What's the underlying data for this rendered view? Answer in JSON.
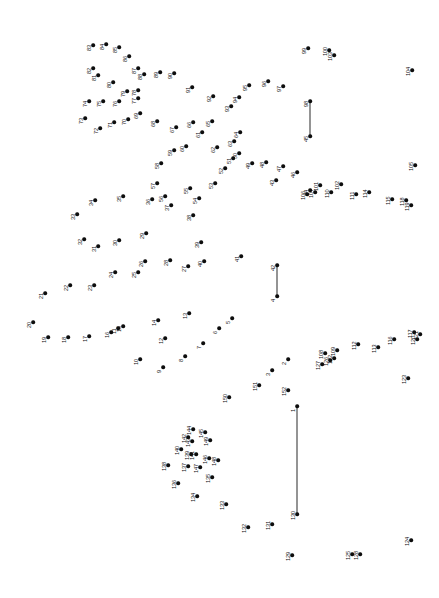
{
  "page": {
    "width": 439,
    "height": 598,
    "background_color": "#ffffff",
    "dot_color": "#0d0d0d",
    "label_color": "#111111",
    "line_color": "#2b2b2b",
    "label_rotation_degrees": -90,
    "total_dots": 152
  },
  "chart_data": {
    "type": "scatter",
    "xlabel": "",
    "ylabel": "",
    "xlim": [
      0,
      439
    ],
    "ylim": [
      0,
      598
    ],
    "grid": false,
    "legend": "none",
    "dots": [
      {
        "n": "1",
        "x": 297,
        "y": 406
      },
      {
        "n": "2",
        "x": 288,
        "y": 359
      },
      {
        "n": "3",
        "x": 272,
        "y": 370
      },
      {
        "n": "4",
        "x": 277,
        "y": 296
      },
      {
        "n": "5",
        "x": 232,
        "y": 318
      },
      {
        "n": "6",
        "x": 219,
        "y": 328
      },
      {
        "n": "7",
        "x": 203,
        "y": 343
      },
      {
        "n": "8",
        "x": 185,
        "y": 356
      },
      {
        "n": "9",
        "x": 163,
        "y": 367
      },
      {
        "n": "10",
        "x": 140,
        "y": 359
      },
      {
        "n": "11",
        "x": 118,
        "y": 328
      },
      {
        "n": "12",
        "x": 165,
        "y": 338
      },
      {
        "n": "13",
        "x": 189,
        "y": 313
      },
      {
        "n": "14",
        "x": 158,
        "y": 320
      },
      {
        "n": "15",
        "x": 123,
        "y": 326
      },
      {
        "n": "16",
        "x": 111,
        "y": 332
      },
      {
        "n": "17",
        "x": 89,
        "y": 336
      },
      {
        "n": "18",
        "x": 68,
        "y": 337
      },
      {
        "n": "19",
        "x": 48,
        "y": 337
      },
      {
        "n": "20",
        "x": 33,
        "y": 322
      },
      {
        "n": "21",
        "x": 45,
        "y": 293
      },
      {
        "n": "22",
        "x": 70,
        "y": 285
      },
      {
        "n": "23",
        "x": 94,
        "y": 285
      },
      {
        "n": "24",
        "x": 115,
        "y": 272
      },
      {
        "n": "25",
        "x": 138,
        "y": 272
      },
      {
        "n": "26",
        "x": 145,
        "y": 261
      },
      {
        "n": "27",
        "x": 188,
        "y": 266
      },
      {
        "n": "28",
        "x": 170,
        "y": 260
      },
      {
        "n": "29",
        "x": 146,
        "y": 233
      },
      {
        "n": "30",
        "x": 119,
        "y": 240
      },
      {
        "n": "31",
        "x": 98,
        "y": 246
      },
      {
        "n": "32",
        "x": 84,
        "y": 239
      },
      {
        "n": "33",
        "x": 77,
        "y": 214
      },
      {
        "n": "34",
        "x": 95,
        "y": 200
      },
      {
        "n": "35",
        "x": 123,
        "y": 196
      },
      {
        "n": "36",
        "x": 152,
        "y": 199
      },
      {
        "n": "37",
        "x": 171,
        "y": 205
      },
      {
        "n": "38",
        "x": 193,
        "y": 215
      },
      {
        "n": "39",
        "x": 201,
        "y": 242
      },
      {
        "n": "40",
        "x": 204,
        "y": 261
      },
      {
        "n": "41",
        "x": 241,
        "y": 256
      },
      {
        "n": "42",
        "x": 277,
        "y": 265
      },
      {
        "n": "43",
        "x": 276,
        "y": 180
      },
      {
        "n": "44",
        "x": 310,
        "y": 190
      },
      {
        "n": "45",
        "x": 310,
        "y": 136
      },
      {
        "n": "46",
        "x": 297,
        "y": 172
      },
      {
        "n": "47",
        "x": 283,
        "y": 166
      },
      {
        "n": "48",
        "x": 266,
        "y": 162
      },
      {
        "n": "49",
        "x": 252,
        "y": 163
      },
      {
        "n": "50",
        "x": 239,
        "y": 153
      },
      {
        "n": "51",
        "x": 233,
        "y": 158
      },
      {
        "n": "52",
        "x": 225,
        "y": 168
      },
      {
        "n": "53",
        "x": 215,
        "y": 183
      },
      {
        "n": "54",
        "x": 199,
        "y": 198
      },
      {
        "n": "55",
        "x": 190,
        "y": 188
      },
      {
        "n": "56",
        "x": 165,
        "y": 196
      },
      {
        "n": "57",
        "x": 157,
        "y": 183
      },
      {
        "n": "58",
        "x": 161,
        "y": 163
      },
      {
        "n": "59",
        "x": 174,
        "y": 150
      },
      {
        "n": "60",
        "x": 186,
        "y": 146
      },
      {
        "n": "61",
        "x": 202,
        "y": 132
      },
      {
        "n": "62",
        "x": 217,
        "y": 147
      },
      {
        "n": "63",
        "x": 234,
        "y": 141
      },
      {
        "n": "64",
        "x": 240,
        "y": 132
      },
      {
        "n": "65",
        "x": 212,
        "y": 121
      },
      {
        "n": "66",
        "x": 193,
        "y": 122
      },
      {
        "n": "67",
        "x": 176,
        "y": 127
      },
      {
        "n": "68",
        "x": 157,
        "y": 121
      },
      {
        "n": "69",
        "x": 140,
        "y": 113
      },
      {
        "n": "70",
        "x": 128,
        "y": 119
      },
      {
        "n": "71",
        "x": 114,
        "y": 122
      },
      {
        "n": "72",
        "x": 100,
        "y": 128
      },
      {
        "n": "73",
        "x": 85,
        "y": 118
      },
      {
        "n": "74",
        "x": 89,
        "y": 101
      },
      {
        "n": "75",
        "x": 103,
        "y": 101
      },
      {
        "n": "76",
        "x": 119,
        "y": 101
      },
      {
        "n": "77",
        "x": 138,
        "y": 98
      },
      {
        "n": "78",
        "x": 138,
        "y": 90
      },
      {
        "n": "79",
        "x": 127,
        "y": 91
      },
      {
        "n": "80",
        "x": 113,
        "y": 82
      },
      {
        "n": "81",
        "x": 98,
        "y": 75
      },
      {
        "n": "82",
        "x": 93,
        "y": 68
      },
      {
        "n": "83",
        "x": 93,
        "y": 45
      },
      {
        "n": "84",
        "x": 106,
        "y": 44
      },
      {
        "n": "85",
        "x": 119,
        "y": 47
      },
      {
        "n": "86",
        "x": 129,
        "y": 56
      },
      {
        "n": "87",
        "x": 138,
        "y": 68
      },
      {
        "n": "88",
        "x": 144,
        "y": 74
      },
      {
        "n": "89",
        "x": 160,
        "y": 72
      },
      {
        "n": "90",
        "x": 174,
        "y": 73
      },
      {
        "n": "91",
        "x": 192,
        "y": 87
      },
      {
        "n": "92",
        "x": 213,
        "y": 96
      },
      {
        "n": "93",
        "x": 231,
        "y": 106
      },
      {
        "n": "94",
        "x": 239,
        "y": 97
      },
      {
        "n": "95",
        "x": 249,
        "y": 85
      },
      {
        "n": "96",
        "x": 268,
        "y": 81
      },
      {
        "n": "97",
        "x": 283,
        "y": 86
      },
      {
        "n": "98",
        "x": 310,
        "y": 101
      },
      {
        "n": "99",
        "x": 308,
        "y": 48
      },
      {
        "n": "100",
        "x": 329,
        "y": 50
      },
      {
        "n": "101",
        "x": 320,
        "y": 185
      },
      {
        "n": "102",
        "x": 341,
        "y": 184
      },
      {
        "n": "103",
        "x": 334,
        "y": 55
      },
      {
        "n": "104",
        "x": 412,
        "y": 70
      },
      {
        "n": "105",
        "x": 415,
        "y": 165
      },
      {
        "n": "106",
        "x": 307,
        "y": 194
      },
      {
        "n": "107",
        "x": 315,
        "y": 192
      },
      {
        "n": "110",
        "x": 331,
        "y": 192
      },
      {
        "n": "111",
        "x": 356,
        "y": 194
      },
      {
        "n": "114",
        "x": 369,
        "y": 192
      },
      {
        "n": "115",
        "x": 392,
        "y": 199
      },
      {
        "n": "118",
        "x": 406,
        "y": 200
      },
      {
        "n": "119",
        "x": 411,
        "y": 205
      },
      {
        "n": "108",
        "x": 325,
        "y": 353
      },
      {
        "n": "109",
        "x": 337,
        "y": 350
      },
      {
        "n": "112",
        "x": 358,
        "y": 344
      },
      {
        "n": "113",
        "x": 378,
        "y": 347
      },
      {
        "n": "116",
        "x": 394,
        "y": 339
      },
      {
        "n": "117",
        "x": 414,
        "y": 332
      },
      {
        "n": "120",
        "x": 417,
        "y": 339
      },
      {
        "n": "121",
        "x": 420,
        "y": 334
      },
      {
        "n": "122",
        "x": 334,
        "y": 358
      },
      {
        "n": "123",
        "x": 408,
        "y": 378
      },
      {
        "n": "124",
        "x": 411,
        "y": 540
      },
      {
        "n": "125",
        "x": 352,
        "y": 554
      },
      {
        "n": "126",
        "x": 330,
        "y": 360
      },
      {
        "n": "127",
        "x": 322,
        "y": 364
      },
      {
        "n": "128",
        "x": 360,
        "y": 554
      },
      {
        "n": "129",
        "x": 292,
        "y": 555
      },
      {
        "n": "130",
        "x": 297,
        "y": 514
      },
      {
        "n": "131",
        "x": 272,
        "y": 524
      },
      {
        "n": "132",
        "x": 248,
        "y": 527
      },
      {
        "n": "133",
        "x": 226,
        "y": 504
      },
      {
        "n": "134",
        "x": 197,
        "y": 496
      },
      {
        "n": "135",
        "x": 212,
        "y": 477
      },
      {
        "n": "136",
        "x": 178,
        "y": 483
      },
      {
        "n": "137",
        "x": 188,
        "y": 466
      },
      {
        "n": "138",
        "x": 168,
        "y": 465
      },
      {
        "n": "139",
        "x": 191,
        "y": 454
      },
      {
        "n": "140",
        "x": 181,
        "y": 449
      },
      {
        "n": "141",
        "x": 196,
        "y": 454
      },
      {
        "n": "142",
        "x": 188,
        "y": 437
      },
      {
        "n": "143",
        "x": 192,
        "y": 441
      },
      {
        "n": "144",
        "x": 193,
        "y": 429
      },
      {
        "n": "145",
        "x": 205,
        "y": 432
      },
      {
        "n": "146",
        "x": 209,
        "y": 458
      },
      {
        "n": "147",
        "x": 200,
        "y": 467
      },
      {
        "n": "148",
        "x": 218,
        "y": 460
      },
      {
        "n": "149",
        "x": 210,
        "y": 440
      },
      {
        "n": "150",
        "x": 229,
        "y": 397
      },
      {
        "n": "151",
        "x": 259,
        "y": 385
      },
      {
        "n": "152",
        "x": 288,
        "y": 390
      }
    ],
    "segments": [
      {
        "from": "45",
        "to": "98",
        "x": 310,
        "y1": 101,
        "y2": 136
      },
      {
        "from": "4",
        "to": "42",
        "x": 277,
        "y1": 265,
        "y2": 296
      },
      {
        "from": "1",
        "to": "130",
        "x": 297,
        "y1": 406,
        "y2": 514
      }
    ]
  }
}
